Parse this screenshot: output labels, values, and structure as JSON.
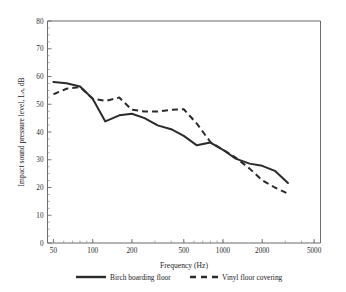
{
  "chart_data": {
    "type": "line",
    "title": "",
    "xlabel": "Frequency (Hz)",
    "ylabel": "Impact sound pressure level, Lₙ, dB",
    "xscale": "log",
    "xlim": [
      45,
      5600
    ],
    "ylim": [
      0,
      80
    ],
    "xticks": [
      50,
      100,
      200,
      500,
      1000,
      2000,
      5000
    ],
    "xticklabels": [
      "50",
      "100",
      "200",
      "500",
      "1000",
      "2000",
      "5000"
    ],
    "yticks": [
      0,
      10,
      20,
      30,
      40,
      50,
      60,
      70,
      80
    ],
    "yticklabels": [
      "0",
      "10",
      "20",
      "30",
      "40",
      "50",
      "60",
      "70",
      "80"
    ],
    "grid": false,
    "legend_position": "below",
    "series": [
      {
        "name": "Birch boarding floor",
        "style": "solid",
        "x": [
          50,
          63,
          80,
          100,
          125,
          160,
          200,
          250,
          315,
          400,
          500,
          630,
          800,
          1000,
          1250,
          1600,
          2000,
          2500,
          3150
        ],
        "values": [
          58.0,
          57.6,
          56.4,
          52.0,
          43.8,
          46.0,
          46.6,
          45.0,
          42.4,
          41.0,
          38.6,
          35.2,
          36.2,
          33.6,
          30.4,
          28.6,
          27.8,
          26.0,
          21.6
        ]
      },
      {
        "name": "Vinyl floor covering",
        "style": "dashed",
        "x": [
          50,
          63,
          80,
          100,
          125,
          160,
          200,
          250,
          315,
          400,
          500,
          630,
          800,
          1000,
          1250,
          1600,
          2000,
          2500,
          3150
        ],
        "values": [
          53.6,
          55.6,
          56.2,
          52.0,
          51.2,
          52.4,
          48.0,
          47.4,
          47.4,
          48.0,
          48.2,
          43.0,
          36.4,
          33.6,
          30.8,
          26.8,
          22.6,
          20.0,
          17.8
        ]
      }
    ]
  },
  "legend": {
    "entries": [
      {
        "label": "Birch boarding floor",
        "style": "solid"
      },
      {
        "label": "Vinyl floor covering",
        "style": "dashed"
      }
    ]
  },
  "colors": {
    "line": "#2b2b2b",
    "axis": "#6b6b6b",
    "background": "#ffffff"
  }
}
